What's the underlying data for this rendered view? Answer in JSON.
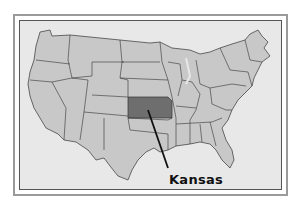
{
  "map": {
    "title": "United States",
    "highlighted_state": "Kansas",
    "callout_label": "Kansas",
    "colors": {
      "background": "#e8e8e8",
      "state_fill": "#c8c8c8",
      "state_border": "#333333",
      "highlight_fill": "#6e6e6e",
      "frame": "#9a9a9a"
    }
  }
}
